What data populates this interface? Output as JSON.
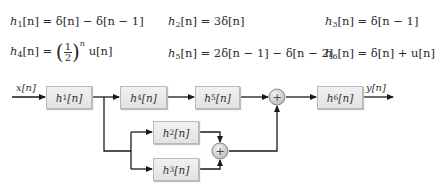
{
  "equations": [
    {
      "id": "h1",
      "name": "h",
      "sub": "1",
      "lhs_arg": "[n]",
      "rhs": "= δ[n] − δ[n − 1]"
    },
    {
      "id": "h2",
      "name": "h",
      "sub": "2",
      "lhs_arg": "[n]",
      "rhs": "= 3δ[n]"
    },
    {
      "id": "h3",
      "name": "h",
      "sub": "3",
      "lhs_arg": "[n]",
      "rhs": "= δ[n − 1]"
    },
    {
      "id": "h4",
      "name": "h",
      "sub": "4",
      "lhs_arg": "[n]",
      "rhs_eq": "=",
      "frac_num": "1",
      "frac_den": "2",
      "exponent": "n",
      "rhs_tail": "u[n]"
    },
    {
      "id": "h5",
      "name": "h",
      "sub": "5",
      "lhs_arg": "[n]",
      "rhs": "= 2δ[n − 1] − δ[n − 2]"
    },
    {
      "id": "h6",
      "name": "h",
      "sub": "6",
      "lhs_arg": "[n]",
      "rhs": "= δ[n] + u[n]"
    }
  ],
  "diagram": {
    "input_label": "x[n]",
    "output_label": "y[n]",
    "blocks": [
      {
        "id": "h1",
        "name": "h",
        "sub": "1",
        "arg": "[n]"
      },
      {
        "id": "h4",
        "name": "h",
        "sub": "4",
        "arg": "[n]"
      },
      {
        "id": "h5",
        "name": "h",
        "sub": "5",
        "arg": "[n]"
      },
      {
        "id": "h6",
        "name": "h",
        "sub": "6",
        "arg": "[n]"
      },
      {
        "id": "h2",
        "name": "h",
        "sub": "2",
        "arg": "[n]"
      },
      {
        "id": "h3",
        "name": "h",
        "sub": "3",
        "arg": "[n]"
      }
    ],
    "adder_symbol": "+",
    "colors": {
      "block_fill": "#e8e8e8",
      "block_border": "#b8b8b8",
      "line": "#1a1a1a",
      "adder_fill": "#d9d9d9"
    }
  }
}
